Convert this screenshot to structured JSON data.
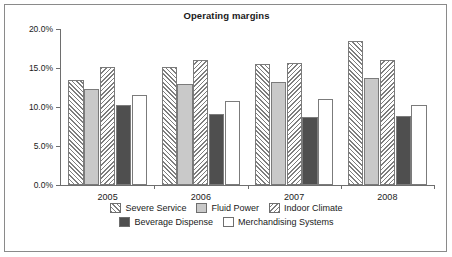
{
  "chart_data": {
    "type": "bar",
    "title": "Operating margins",
    "xlabel": "",
    "ylabel": "",
    "categories": [
      "2005",
      "2006",
      "2007",
      "2008"
    ],
    "ylim": [
      0,
      20
    ],
    "ytick_labels": [
      "0.0%",
      "5.0%",
      "10.0%",
      "15.0%",
      "20.0%"
    ],
    "ytick_values": [
      0,
      5,
      10,
      15,
      20
    ],
    "grid": false,
    "legend_position": "bottom",
    "value_unit": "%",
    "series": [
      {
        "name": "Severe Service",
        "pattern": "diagonal-hatch-forward",
        "color": "#ffffff",
        "values": [
          13.4,
          15.1,
          15.5,
          18.4
        ]
      },
      {
        "name": "Fluid Power",
        "pattern": "solid-light-gray",
        "color": "#c9c9c9",
        "values": [
          12.3,
          12.9,
          13.2,
          13.7
        ]
      },
      {
        "name": "Indoor Climate",
        "pattern": "diagonal-hatch-backward",
        "color": "#ffffff",
        "values": [
          15.1,
          16.0,
          15.6,
          16.0
        ]
      },
      {
        "name": "Beverage Dispense",
        "pattern": "solid-dark-gray",
        "color": "#4f4f4f",
        "values": [
          10.3,
          9.1,
          8.7,
          8.9
        ]
      },
      {
        "name": "Merchandising Systems",
        "pattern": "solid-white",
        "color": "#ffffff",
        "values": [
          11.6,
          10.8,
          11.0,
          10.2
        ]
      }
    ]
  }
}
